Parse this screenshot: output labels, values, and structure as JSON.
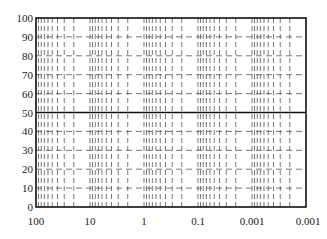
{
  "chart_data": {
    "type": "line",
    "title": "",
    "xlabel": "",
    "ylabel": "",
    "x_scale": "log-reversed",
    "x_tick_labels": [
      "100",
      "10",
      "1",
      "0.1",
      "0.001",
      "0.001"
    ],
    "y_tick_labels": [
      "0",
      "10",
      "20",
      "30",
      "40",
      "50",
      "60",
      "70",
      "80",
      "90",
      "100"
    ],
    "y_ticks": [
      0,
      10,
      20,
      30,
      40,
      50,
      60,
      70,
      80,
      90,
      100
    ],
    "ylim": [
      0,
      100
    ],
    "decades": 5,
    "grid": {
      "horizontal_dashed": [
        10,
        20,
        30,
        40,
        60,
        70,
        80,
        90
      ],
      "horizontal_solid": [
        50
      ],
      "vertical_minor_per_decade": [
        0.9,
        0.8,
        0.7,
        0.6,
        0.5,
        0.4,
        0.3,
        0.2
      ],
      "style": "dashed"
    },
    "series": [],
    "legend": null
  },
  "colors": {
    "frame": "#111111",
    "grid": "#555555",
    "text": "#222222",
    "background": "#ffffff"
  },
  "layout": {
    "plot_left": 36,
    "plot_right": 306,
    "plot_top": 18,
    "plot_bottom": 207
  }
}
